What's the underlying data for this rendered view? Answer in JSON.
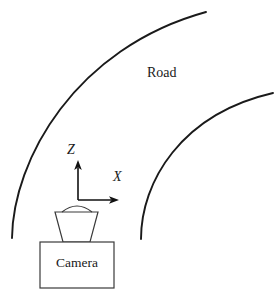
{
  "figure": {
    "name": "road-camera-coordinate-diagram",
    "width": 278,
    "height": 298,
    "background_color": "#ffffff",
    "stroke_color": "#1a1a1a"
  },
  "labels": {
    "road": "Road",
    "camera": "Camera",
    "axis_z": "Z",
    "axis_x": "X"
  },
  "road": {
    "outer_curve": {
      "name": "outer-road-edge",
      "start": [
        12,
        238
      ],
      "end": [
        206,
        12
      ],
      "control": [
        22,
        36
      ]
    },
    "inner_curve": {
      "name": "inner-road-edge",
      "start": [
        141,
        239
      ],
      "end": [
        273,
        93
      ],
      "control": [
        150,
        105
      ]
    }
  },
  "axes": {
    "origin": [
      78,
      200
    ],
    "z_tip": [
      78,
      161
    ],
    "x_tip": [
      119,
      200
    ],
    "arrow_color": "#111111"
  },
  "camera": {
    "body_box": {
      "x": 40,
      "y": 242,
      "width": 74,
      "height": 46
    },
    "lens_trapezoid": {
      "top_left": [
        55,
        212
      ],
      "top_right": [
        98,
        212
      ],
      "bottom_right": [
        90,
        242
      ],
      "bottom_left": [
        63,
        242
      ]
    },
    "dome": {
      "start": [
        62,
        212
      ],
      "end": [
        92,
        212
      ],
      "peak_y": 204
    },
    "outline_color": "#3a3a3a"
  }
}
